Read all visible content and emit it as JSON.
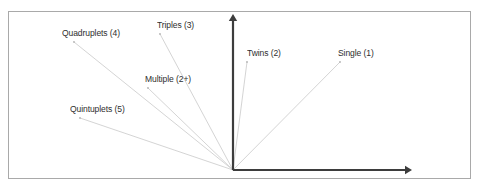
{
  "figure": {
    "border": {
      "x": 8,
      "y": 11,
      "width": 462,
      "height": 167,
      "color": "#a9a9a9",
      "stroke_width": 1
    },
    "axes": {
      "color": "#3d3d3d",
      "stroke_width": 2.2,
      "origin": {
        "x": 233,
        "y": 170
      },
      "y_axis_top": {
        "x": 233,
        "y": 14
      },
      "x_axis_right": {
        "x": 412,
        "y": 170
      },
      "arrowheads": [
        "y-axis-up-arrow",
        "x-axis-right-arrow"
      ]
    },
    "rays": {
      "color": "#cfcfcf",
      "stroke_width": 0.9,
      "dot_color": "#b5b5b5",
      "dot_radius": 0.9
    }
  },
  "chart_data": {
    "type": "scatter",
    "title": "",
    "xlabel": "",
    "ylabel": "",
    "origin": {
      "x": 233,
      "y": 170
    },
    "points": [
      {
        "label": "Single (1)",
        "multiplicity": 1,
        "endpoint": {
          "x": 340,
          "y": 62
        },
        "label_pos": {
          "x": 338,
          "y": 48
        }
      },
      {
        "label": "Twins (2)",
        "multiplicity": 2,
        "endpoint": {
          "x": 247,
          "y": 62
        },
        "label_pos": {
          "x": 247,
          "y": 48
        }
      },
      {
        "label": "Triples (3)",
        "multiplicity": 3,
        "endpoint": {
          "x": 160,
          "y": 34
        },
        "label_pos": {
          "x": 157,
          "y": 20
        }
      },
      {
        "label": "Multiple (2+)",
        "multiplicity": null,
        "endpoint": {
          "x": 148,
          "y": 88
        },
        "label_pos": {
          "x": 145,
          "y": 74
        }
      },
      {
        "label": "Quadruplets (4)",
        "multiplicity": 4,
        "endpoint": {
          "x": 74,
          "y": 42
        },
        "label_pos": {
          "x": 62,
          "y": 28
        }
      },
      {
        "label": "Quintuplets (5)",
        "multiplicity": 5,
        "endpoint": {
          "x": 80,
          "y": 118
        },
        "label_pos": {
          "x": 70,
          "y": 104
        }
      }
    ]
  }
}
